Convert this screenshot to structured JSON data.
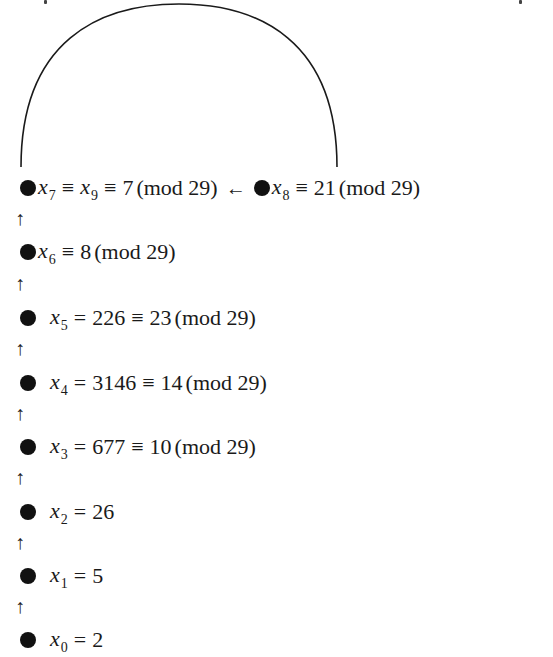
{
  "diagram": {
    "title": "",
    "modulus": "29",
    "cycle_arc": {
      "from": "x_8",
      "to": "x_7",
      "shape": "semicircle-arc-above"
    },
    "nodes": [
      {
        "id": "x7",
        "var": "x",
        "sub": "7",
        "extra_var": "x",
        "extra_sub": "9",
        "expr": "≡",
        "expr2": "≡",
        "value": "7",
        "mod": "(mod 29)"
      },
      {
        "id": "x8",
        "var": "x",
        "sub": "8",
        "expr": "≡",
        "value": "21",
        "mod": "(mod 29)"
      },
      {
        "id": "x6",
        "var": "x",
        "sub": "6",
        "expr": "≡",
        "value": "8",
        "mod": "(mod 29)"
      },
      {
        "id": "x5",
        "var": "x",
        "sub": "5",
        "expr": "=",
        "raw": "226",
        "expr2": "≡",
        "value": "23",
        "mod": "(mod 29)"
      },
      {
        "id": "x4",
        "var": "x",
        "sub": "4",
        "expr": "=",
        "raw": "3146",
        "expr2": "≡",
        "value": "14",
        "mod": "(mod 29)"
      },
      {
        "id": "x3",
        "var": "x",
        "sub": "3",
        "expr": "=",
        "raw": "677",
        "expr2": "≡",
        "value": "10",
        "mod": "(mod 29)"
      },
      {
        "id": "x2",
        "var": "x",
        "sub": "2",
        "expr": "=",
        "value": "26"
      },
      {
        "id": "x1",
        "var": "x",
        "sub": "1",
        "expr": "=",
        "value": "5"
      },
      {
        "id": "x0",
        "var": "x",
        "sub": "0",
        "expr": "=",
        "value": "2"
      }
    ],
    "arrows": {
      "up": "↑",
      "left": "←"
    },
    "colors": {
      "ink": "#111111",
      "background": "#ffffff"
    }
  }
}
